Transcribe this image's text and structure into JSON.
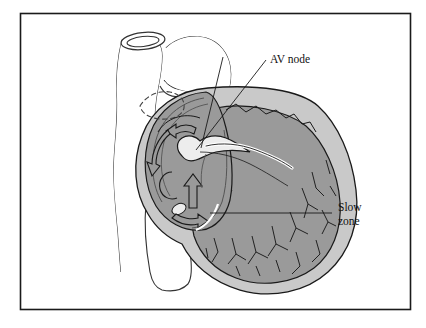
{
  "figure": {
    "frame": {
      "border_color": "#1a1a1a",
      "background": "#ffffff"
    },
    "palette": {
      "chamber_fill": "#9a9a9a",
      "myocardium_fill": "#c9c9c9",
      "vessel_fill": "#ffffff",
      "node_fill": "#ededed",
      "outline": "#1a1a1a",
      "label_color": "#111111",
      "leader_color": "#1a1a1a"
    },
    "labels": [
      {
        "id": "av-node",
        "text": "AV node",
        "lines": [
          "AV node"
        ],
        "x": 268,
        "y": 62
      },
      {
        "id": "slow-zone",
        "text": "Slow zone",
        "lines": [
          "Slow",
          "zone"
        ],
        "x": 336,
        "y": 211
      }
    ],
    "structures": [
      {
        "id": "superior-vena-cava",
        "name": "superior vena cava"
      },
      {
        "id": "aorta",
        "name": "aorta"
      },
      {
        "id": "pulmonary-artery",
        "name": "pulmonary artery"
      },
      {
        "id": "inferior-vena-cava",
        "name": "inferior vena cava"
      },
      {
        "id": "right-atrium",
        "name": "right atrium"
      },
      {
        "id": "right-ventricle",
        "name": "right ventricle"
      },
      {
        "id": "myocardium",
        "name": "myocardium wall"
      },
      {
        "id": "av-node-body",
        "name": "AV node"
      },
      {
        "id": "his-bundle",
        "name": "bundle of His"
      },
      {
        "id": "coronary-sinus",
        "name": "coronary sinus ostium"
      },
      {
        "id": "trabeculae",
        "name": "trabeculae carneae"
      },
      {
        "id": "reentry-arrows",
        "name": "reentrant circuit arrows"
      },
      {
        "id": "dashed-outline",
        "name": "hidden vessel dashed outline"
      }
    ]
  }
}
